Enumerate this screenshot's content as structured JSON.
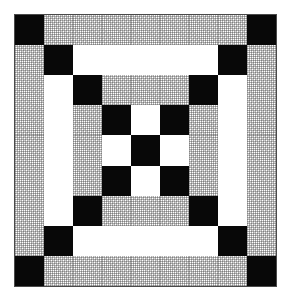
{
  "figure": {
    "kind": "quilt-block-diagram",
    "title": "Quilt Block Pattern",
    "background_color": "#ffffff",
    "border_color": "#4a4a4a",
    "canvas": {
      "width": 290,
      "height": 300
    }
  },
  "block": {
    "name": "Nested Square Quilt Block",
    "grid_columns": 9,
    "grid_rows": 9,
    "x": 14,
    "y": 14,
    "width": 263,
    "height": 273
  },
  "palette": {
    "black": "#080808",
    "white": "#ffffff",
    "gray": "#e3e3e3",
    "outline": "#4a4a4a"
  },
  "legend": {
    "black_label": "black",
    "white_label": "white",
    "gray_label": "gray"
  },
  "rings": [
    {
      "index": 1,
      "name": "outer-ring",
      "bar_color": "gray",
      "corner_color": "black"
    },
    {
      "index": 2,
      "name": "middle-ring",
      "bar_color": "white",
      "corner_color": "black"
    },
    {
      "index": 3,
      "name": "inner-ring",
      "bar_color": "gray",
      "corner_color": "black"
    },
    {
      "index": 4,
      "name": "center-checkerboard",
      "bar_color": "white",
      "corner_color": "black"
    }
  ],
  "patch_grid": [
    [
      "black",
      "gray",
      "gray",
      "gray",
      "gray",
      "gray",
      "gray",
      "gray",
      "black"
    ],
    [
      "gray",
      "black",
      "white",
      "white",
      "white",
      "white",
      "white",
      "black",
      "gray"
    ],
    [
      "gray",
      "white",
      "black",
      "gray",
      "gray",
      "gray",
      "black",
      "white",
      "gray"
    ],
    [
      "gray",
      "white",
      "gray",
      "black",
      "white",
      "black",
      "gray",
      "white",
      "gray"
    ],
    [
      "gray",
      "white",
      "gray",
      "white",
      "black",
      "white",
      "gray",
      "white",
      "gray"
    ],
    [
      "gray",
      "white",
      "gray",
      "black",
      "white",
      "black",
      "gray",
      "white",
      "gray"
    ],
    [
      "gray",
      "white",
      "black",
      "gray",
      "gray",
      "gray",
      "black",
      "white",
      "gray"
    ],
    [
      "gray",
      "black",
      "white",
      "white",
      "white",
      "white",
      "white",
      "black",
      "gray"
    ],
    [
      "black",
      "gray",
      "gray",
      "gray",
      "gray",
      "gray",
      "gray",
      "gray",
      "black"
    ]
  ]
}
